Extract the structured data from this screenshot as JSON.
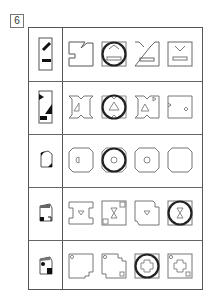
{
  "question": {
    "number": "6"
  },
  "rows": [
    {
      "id": 1,
      "key": "rect-with-diagonal-and-bar",
      "options": [
        "notched-L",
        "chevron-up-bar",
        "double-slash-bar",
        "chevron-down-bar"
      ],
      "circled_option": 2
    },
    {
      "id": 2,
      "key": "rect-with-triangles-and-bar",
      "options": [
        "notched-triangle-left",
        "notched-triangle-center",
        "notched-triangle-flag",
        "notched-diamond-right"
      ],
      "circled_option": 2
    },
    {
      "id": 3,
      "key": "octagon-with-corner-tabs",
      "options": [
        "octagon-half-circle",
        "octagon-circle",
        "octagon-circle-small",
        "octagon-empty"
      ],
      "circled_option": 2
    },
    {
      "id": 4,
      "key": "folded-corner-square",
      "options": [
        "bracket-triangle",
        "square-hourglass-corners",
        "notched-triangle-down",
        "square-hourglass"
      ],
      "circled_option": 4
    },
    {
      "id": 5,
      "key": "square-dots-fold",
      "options": [
        "cut-corner-dot",
        "cut-corners-dots",
        "square-cross-octagon",
        "square-cross-dots"
      ],
      "circled_option": 3
    }
  ],
  "colors": {
    "line": "#555555",
    "circle": "#222222",
    "faint": "#888888"
  }
}
